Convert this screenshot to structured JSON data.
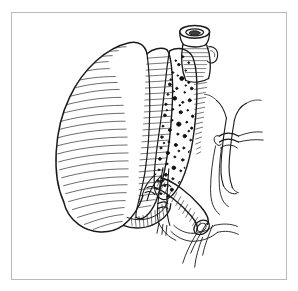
{
  "figure": {
    "title": "Surgical line drawing: gastric resection with vascular ligation",
    "medium": "pen-and-ink line art",
    "background_color": "#ffffff",
    "ink_color": "#1a1a1a",
    "frame": {
      "border_color": "#b9b9b9",
      "border_width_px": 1,
      "x": 11,
      "y": 12,
      "width": 276,
      "height": 268
    },
    "canvas": {
      "width": 298,
      "height": 291
    },
    "structures": [
      {
        "id": "stomach-body",
        "label": "Stomach body (greater curvature)",
        "rendering": "curved parallel hatching following organ contour",
        "region": "left and center"
      },
      {
        "id": "esophageal-stump",
        "label": "Transected tubular stump with open lumen",
        "rendering": "elliptical ring with inner lumen, cross-hatched wall",
        "region": "top center"
      },
      {
        "id": "fatty-tissue",
        "label": "Omental / fatty tissue with stippled fat lobules",
        "rendering": "dense stipple dots of varied size",
        "region": "center right of stomach"
      },
      {
        "id": "ligated-vessel-upper",
        "label": "Ligated vessel with suture tie",
        "rendering": "twin parallel lines with knot and free suture tails",
        "region": "upper right"
      },
      {
        "id": "divided-vessel-lower",
        "label": "Divided vessel stump with visible lumen",
        "rendering": "tubular form with transverse hatch rings and open elliptical cut end",
        "region": "lower right center"
      },
      {
        "id": "suture-tails",
        "label": "Free suture / ligature tails",
        "rendering": "fine trailing curved lines",
        "region": "lower right"
      },
      {
        "id": "vascular-pedicle",
        "label": "Vascular pedicle branches",
        "rendering": "thin branching paired outlines",
        "region": "center bottom"
      }
    ],
    "labels": [],
    "annotations": []
  }
}
